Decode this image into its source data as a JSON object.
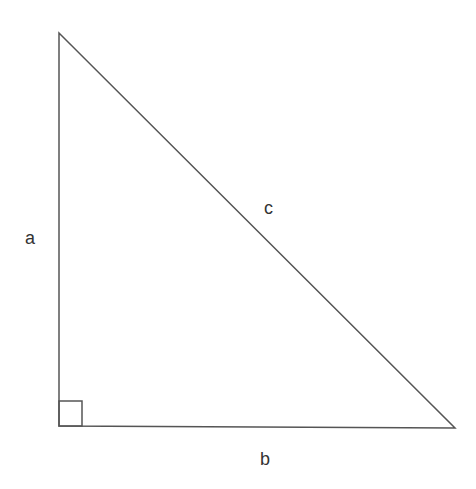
{
  "diagram": {
    "labels": {
      "a": "a",
      "b": "b",
      "c": "c"
    },
    "stroke_color": "#555555",
    "label_color": "#333333"
  }
}
